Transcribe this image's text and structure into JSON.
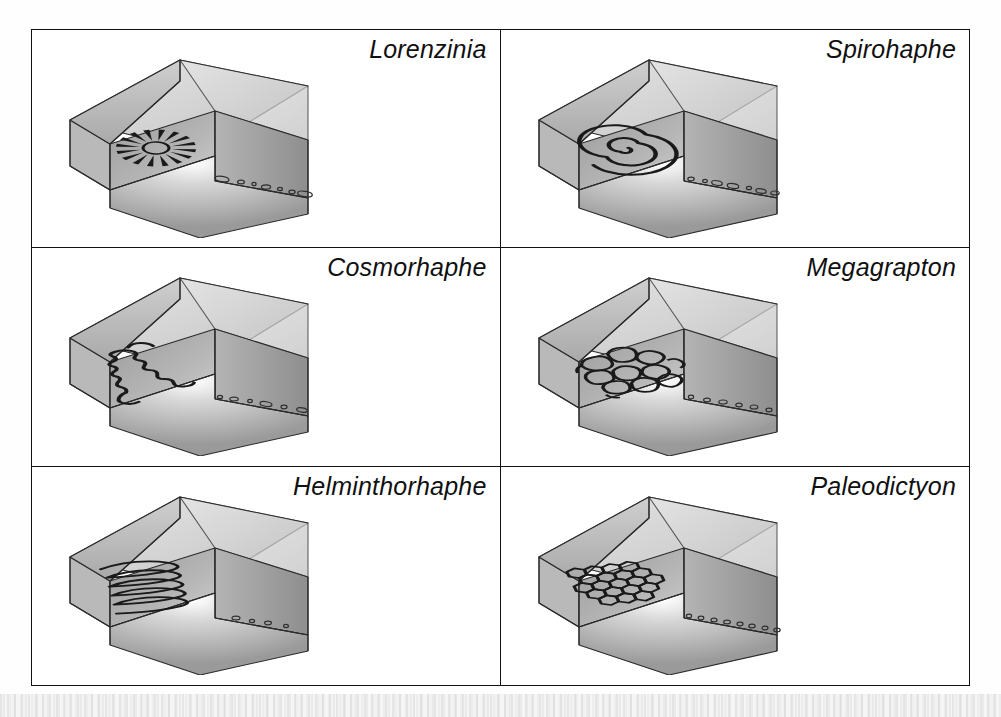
{
  "figure": {
    "kind": "plate-of-block-diagrams",
    "columns": 2,
    "rows": 3,
    "background_color": "#ffffff",
    "frame_color": "#111111"
  },
  "panels": [
    {
      "id": "lorenzinia",
      "label": "Lorenzinia",
      "trace_pattern": "radial-rosette",
      "pattern_description": "radial rosette of ~16 tapering rays around a central oval disc",
      "ray_count": 16,
      "has_bedding_burrows": true,
      "burrow_count": 7
    },
    {
      "id": "spirohaphe",
      "label": "Spirohaphe",
      "trace_pattern": "spiral",
      "pattern_description": "tightly coiled planispiral with about 2.5 whorls",
      "whorls": 2.5,
      "has_bedding_burrows": true,
      "burrow_count": 7
    },
    {
      "id": "cosmorhaphe",
      "label": "Cosmorhaphe",
      "trace_pattern": "second-order-meander",
      "pattern_description": "large first-order meander carrying small second-order wiggles",
      "meander_order": 2,
      "has_bedding_burrows": true,
      "burrow_count": 6
    },
    {
      "id": "megagrapton",
      "label": "Megagrapton",
      "trace_pattern": "irregular-network",
      "pattern_description": "irregular rounded polygonal meshwork of burrows",
      "cell_count": 14,
      "has_bedding_burrows": true,
      "burrow_count": 6
    },
    {
      "id": "helminthorhaphe",
      "label": "Helminthorhaphe",
      "trace_pattern": "tight-meander",
      "pattern_description": "tight parallel hairpin meander loops",
      "loop_count": 5,
      "has_bedding_burrows": true,
      "burrow_count": 4
    },
    {
      "id": "paleodictyon",
      "label": "Paleodictyon",
      "trace_pattern": "regular-hexagonal-network",
      "pattern_description": "regular honeycomb of uniform hexagonal meshes",
      "cell_count": 20,
      "has_bedding_burrows": true,
      "burrow_count": 8
    }
  ],
  "block": {
    "description": "cut-away sediment block with stepped notch exposing a bedding plane",
    "faces": [
      "top",
      "front",
      "right",
      "notch-floor",
      "notch-back-wall",
      "notch-side-wall"
    ],
    "top_face_color": "#d6d6d6",
    "front_face_color": "#a8a8a8",
    "right_face_color": "#9a9a9a",
    "notch_floor_color": "#8f8f8f",
    "notch_wall_color": "#b4b4b4",
    "trace_color": "#1a1a1a",
    "edge_color": "#2b2b2b"
  }
}
